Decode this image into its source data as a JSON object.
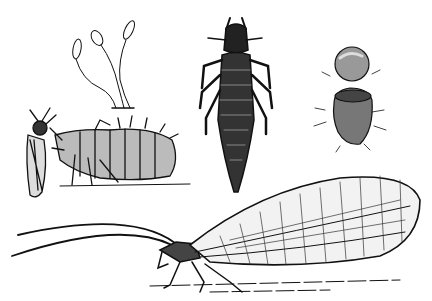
{
  "illustration": {
    "subject": "Lacewing life cycle engraving",
    "colors": {
      "ink": "#111111",
      "paper": "#ffffff"
    },
    "panels": [
      {
        "id": "eggs-on-stalks",
        "label": "stalked eggs"
      },
      {
        "id": "larva-feeding",
        "label": "larva eating aphid"
      },
      {
        "id": "larva-dorsal",
        "label": "larva dorsal view"
      },
      {
        "id": "cocoon",
        "label": "opened cocoon"
      },
      {
        "id": "adult",
        "label": "adult lacewing"
      }
    ]
  }
}
